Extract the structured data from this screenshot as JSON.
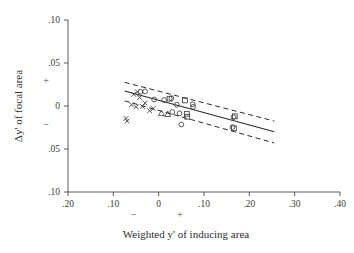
{
  "chart_data": {
    "type": "scatter",
    "title": "",
    "xlabel": "Weighted y' of inducing area",
    "ylabel": "Δy' of focal area",
    "xlim": [
      -0.2,
      0.4
    ],
    "ylim": [
      -0.1,
      0.1
    ],
    "grid": false,
    "legend_position": "none",
    "x_ticks": [
      {
        "value": -0.2,
        "label": ".20"
      },
      {
        "value": -0.1,
        "label": ".10"
      },
      {
        "value": 0.0,
        "label": "0"
      },
      {
        "value": 0.1,
        "label": ".10"
      },
      {
        "value": 0.2,
        "label": ".20"
      },
      {
        "value": 0.3,
        "label": ".30"
      },
      {
        "value": 0.4,
        "label": ".40"
      }
    ],
    "y_ticks": [
      {
        "value": 0.1,
        "label": ".10"
      },
      {
        "value": 0.05,
        "label": ".05"
      },
      {
        "value": 0.0,
        "label": "0"
      },
      {
        "value": -0.05,
        "label": ".05"
      },
      {
        "value": -0.1,
        "label": ".10"
      }
    ],
    "x_sign_annotations": [
      {
        "value": -0.055,
        "label": "−"
      },
      {
        "value": 0.047,
        "label": "+"
      }
    ],
    "y_sign_annotations": [
      {
        "value": 0.03,
        "label": "+"
      },
      {
        "value": -0.022,
        "label": "−"
      }
    ],
    "series": [
      {
        "name": "cross markers",
        "marker": "x",
        "points": [
          {
            "x": -0.055,
            "y": 0.0135
          },
          {
            "x": -0.047,
            "y": 0.0165
          },
          {
            "x": -0.042,
            "y": 0.01
          },
          {
            "x": -0.06,
            "y": 0.0015
          },
          {
            "x": -0.05,
            "y": -0.001
          },
          {
            "x": -0.036,
            "y": -0.0005
          },
          {
            "x": -0.03,
            "y": 0.0035
          },
          {
            "x": -0.072,
            "y": -0.0145
          },
          {
            "x": -0.07,
            "y": -0.0175
          },
          {
            "x": -0.02,
            "y": -0.0055
          },
          {
            "x": -0.012,
            "y": -0.003
          }
        ]
      },
      {
        "name": "circle markers",
        "marker": "circle",
        "points": [
          {
            "x": -0.04,
            "y": 0.0165
          },
          {
            "x": -0.03,
            "y": 0.017
          },
          {
            "x": -0.01,
            "y": 0.0075
          },
          {
            "x": 0.012,
            "y": 0.007
          },
          {
            "x": 0.028,
            "y": 0.009
          },
          {
            "x": 0.04,
            "y": 0.0015
          },
          {
            "x": 0.075,
            "y": 0.002
          },
          {
            "x": 0.076,
            "y": -0.001
          },
          {
            "x": 0.03,
            "y": -0.007
          },
          {
            "x": 0.046,
            "y": -0.0085
          },
          {
            "x": 0.05,
            "y": -0.0215
          },
          {
            "x": 0.165,
            "y": -0.013
          },
          {
            "x": 0.163,
            "y": -0.0245
          }
        ]
      },
      {
        "name": "square markers",
        "marker": "square",
        "points": [
          {
            "x": 0.024,
            "y": 0.0085
          },
          {
            "x": 0.058,
            "y": 0.0065
          },
          {
            "x": 0.062,
            "y": -0.009
          },
          {
            "x": 0.063,
            "y": -0.0125
          },
          {
            "x": 0.168,
            "y": -0.012
          },
          {
            "x": 0.166,
            "y": -0.026
          }
        ]
      },
      {
        "name": "triangle markers",
        "marker": "triangle",
        "points": [
          {
            "x": 0.006,
            "y": -0.0085
          },
          {
            "x": 0.02,
            "y": -0.0095
          }
        ]
      }
    ],
    "fit_line": {
      "name": "regression line",
      "style": "solid",
      "x_start": -0.075,
      "y_start": 0.0175,
      "x_end": 0.255,
      "y_end": -0.03
    },
    "confidence_bands": [
      {
        "name": "upper band",
        "style": "dashed",
        "x_start": -0.075,
        "y_start": 0.0275,
        "x_end": 0.255,
        "y_end": -0.0175
      },
      {
        "name": "lower band",
        "style": "dashed",
        "x_start": -0.075,
        "y_start": 0.006,
        "x_end": 0.255,
        "y_end": -0.043
      }
    ]
  }
}
